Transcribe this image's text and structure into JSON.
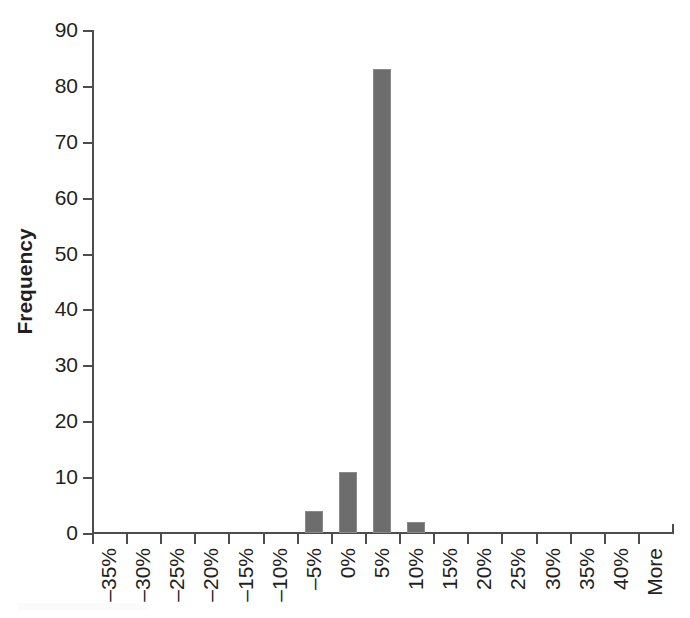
{
  "chart_data": {
    "type": "bar",
    "title": "",
    "subtitle": "",
    "xlabel": "",
    "ylabel": "Frequency",
    "categories": [
      "–35%",
      "–30%",
      "–25%",
      "–20%",
      "–15%",
      "–10%",
      "–5%",
      "0%",
      "5%",
      "10%",
      "15%",
      "20%",
      "25%",
      "30%",
      "35%",
      "40%",
      "More"
    ],
    "values": [
      0,
      0,
      0,
      0,
      0,
      0,
      4,
      11,
      83,
      2,
      0,
      0,
      0,
      0,
      0,
      0,
      0
    ],
    "ylim": [
      0,
      90
    ],
    "yticks": [
      0,
      10,
      20,
      30,
      40,
      50,
      60,
      70,
      80,
      90
    ],
    "ytick_labels": [
      "0",
      "10",
      "20",
      "30",
      "40",
      "50",
      "60",
      "70",
      "80",
      "90"
    ],
    "grid": false,
    "legend": false,
    "legend_position": "none",
    "bar_color": "#6d6d6d",
    "axis_color": "#4d4d4d",
    "background_color": "#ffffff"
  }
}
